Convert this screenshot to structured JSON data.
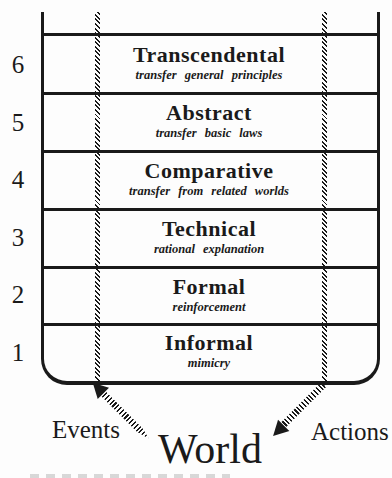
{
  "figure": {
    "levels": [
      {
        "number": "6",
        "title": "Transcendental",
        "subtitle": "transfer general principles"
      },
      {
        "number": "5",
        "title": "Abstract",
        "subtitle": "transfer basic laws"
      },
      {
        "number": "4",
        "title": "Comparative",
        "subtitle": "transfer from related worlds"
      },
      {
        "number": "3",
        "title": "Technical",
        "subtitle": "rational explanation"
      },
      {
        "number": "2",
        "title": "Formal",
        "subtitle": "reinforcement"
      },
      {
        "number": "1",
        "title": "Informal",
        "subtitle": "mimicry"
      }
    ],
    "bottom": {
      "left_label": "Events",
      "center_label": "World",
      "right_label": "Actions"
    },
    "colors": {
      "ink": "#1a1a1a",
      "paper": "#fdfdfd"
    }
  }
}
